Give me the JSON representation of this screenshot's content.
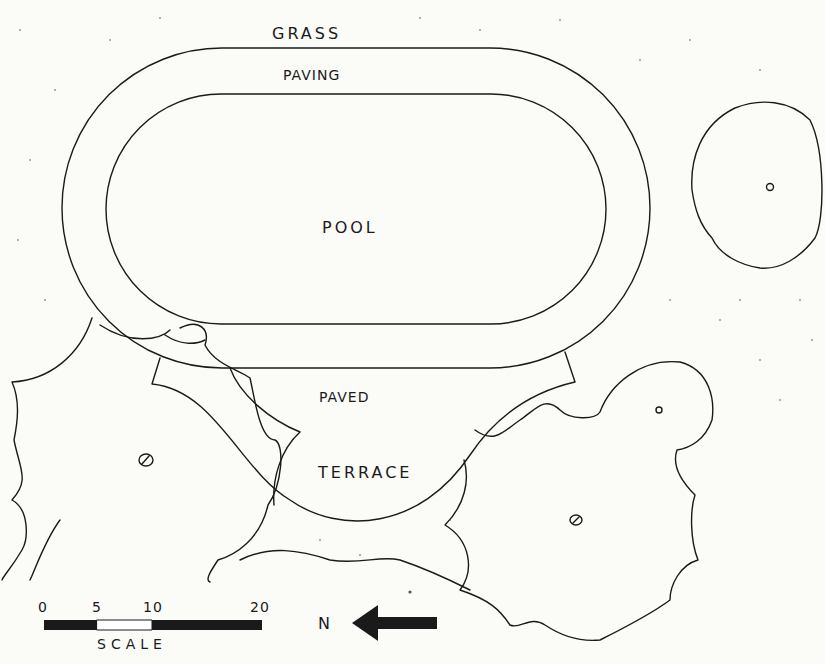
{
  "labels": {
    "grass": "GRASS",
    "paving": "PAVING",
    "pool": "POOL",
    "paved": "PAVED",
    "terrace": "TERRACE"
  },
  "scale": {
    "ticks": [
      "0",
      "5",
      "10",
      "20"
    ],
    "label": "SCALE"
  },
  "north": {
    "label": "N"
  },
  "colors": {
    "ink": "#1a1a1a",
    "paper": "#fbfbf8"
  }
}
